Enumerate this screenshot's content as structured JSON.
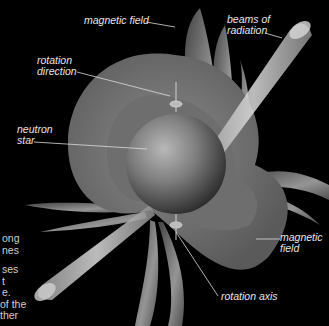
{
  "diagram": {
    "colors": {
      "background": "#000000",
      "field": "#9a9a9a",
      "star": "#7a7a7a",
      "beam": "#c8c8c8",
      "label_text": "#e6e6e6"
    },
    "labels": {
      "magnetic_field_top": "magnetic field",
      "beams": [
        "beams of",
        "radiation"
      ],
      "rotation_direction": [
        "rotation",
        "direction"
      ],
      "neutron_star": [
        "neutron",
        "star"
      ],
      "magnetic_field_right": [
        "magnetic",
        "field"
      ],
      "rotation_axis": "rotation axis"
    },
    "cropped_side_text": [
      "ong",
      "nes",
      "",
      "ses",
      "t",
      "e.",
      "of the",
      "ther"
    ]
  }
}
